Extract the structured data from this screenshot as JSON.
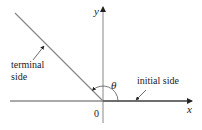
{
  "diagram": {
    "type": "angle-in-standard-position",
    "axes": {
      "x_label": "x",
      "y_label": "y",
      "origin_label": "0"
    },
    "angle_label": "θ",
    "terminal_side_label_line1": "terminal",
    "terminal_side_label_line2": "side",
    "initial_side_label": "initial side",
    "colors": {
      "axis": "#555555",
      "ray": "#777777",
      "text": "#222222"
    }
  }
}
